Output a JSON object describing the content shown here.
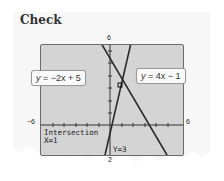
{
  "title": "Check",
  "graph": {
    "window": {
      "xmin": -6,
      "xmax": 6,
      "ymin": 2,
      "ymax": 6
    },
    "tick_labels": {
      "left": "−6",
      "right": "6",
      "top": "6",
      "bottom": "2"
    },
    "equations": [
      {
        "label_var": "y",
        "label_rest": " = −2x + 5",
        "slope": -2,
        "intercept": 5
      },
      {
        "label_var": "y",
        "label_rest": " = 4x − 1",
        "slope": 4,
        "intercept": -1
      }
    ],
    "readout": {
      "heading": "Intersection",
      "x": "X=1",
      "y": "Y=3"
    }
  },
  "colors": {
    "screen": "#d4d4d4",
    "line": "#2a2a2a",
    "paper": "#f7f7f7"
  }
}
